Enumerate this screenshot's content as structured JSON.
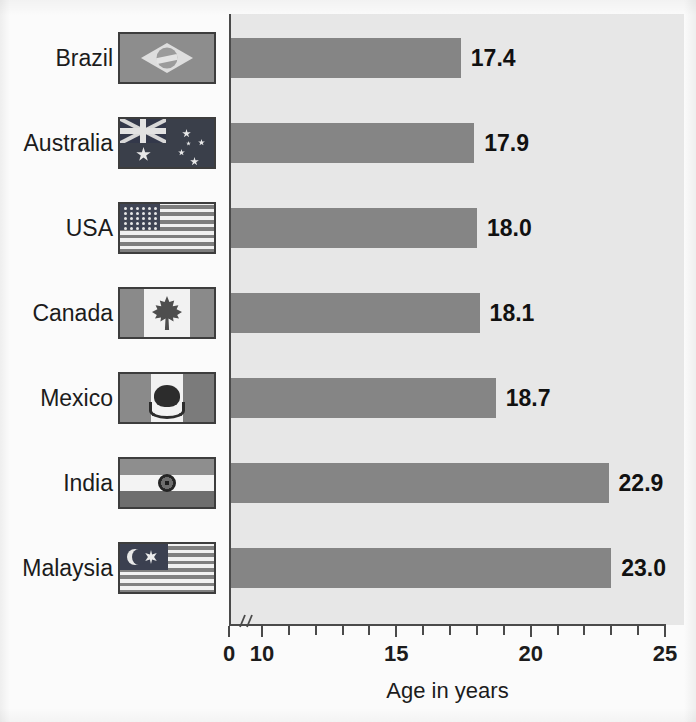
{
  "chart_data": {
    "type": "bar",
    "orientation": "horizontal",
    "title": "",
    "xlabel": "Age in years",
    "ylabel": "",
    "xlim": [
      0,
      25
    ],
    "axis_break": true,
    "axis_break_note": "broken axis between 0 and 10",
    "grid": false,
    "legend": "none",
    "tick_labels": [
      "0",
      "10",
      "15",
      "20",
      "25"
    ],
    "tick_values": [
      0,
      10,
      15,
      20,
      25
    ],
    "minor_tick_step": 1,
    "categories": [
      "Brazil",
      "Australia",
      "USA",
      "Canada",
      "Mexico",
      "India",
      "Malaysia"
    ],
    "values": [
      17.4,
      17.9,
      18.0,
      18.1,
      18.7,
      22.9,
      23.0
    ],
    "value_labels": [
      "17.4",
      "17.9",
      "18.0",
      "18.1",
      "18.7",
      "22.9",
      "23.0"
    ],
    "bar_color": "#858585",
    "plot_background": "#e7e7e7",
    "axis_color": "#4a4a4a"
  },
  "rows": [
    {
      "country": "Brazil",
      "value": 17.4,
      "label": "17.4",
      "flag": "brazil-flag-icon"
    },
    {
      "country": "Australia",
      "value": 17.9,
      "label": "17.9",
      "flag": "australia-flag-icon"
    },
    {
      "country": "USA",
      "value": 18.0,
      "label": "18.0",
      "flag": "usa-flag-icon"
    },
    {
      "country": "Canada",
      "value": 18.1,
      "label": "18.1",
      "flag": "canada-flag-icon"
    },
    {
      "country": "Mexico",
      "value": 18.7,
      "label": "18.7",
      "flag": "mexico-flag-icon"
    },
    {
      "country": "India",
      "value": 22.9,
      "label": "22.9",
      "flag": "india-flag-icon"
    },
    {
      "country": "Malaysia",
      "value": 23.0,
      "label": "23.0",
      "flag": "malaysia-flag-icon"
    }
  ],
  "axis": {
    "title": "Age in years",
    "ticks": [
      {
        "label": "0",
        "value": 0
      },
      {
        "label": "10",
        "value": 10
      },
      {
        "label": "15",
        "value": 15
      },
      {
        "label": "20",
        "value": 20
      },
      {
        "label": "25",
        "value": 25
      }
    ]
  }
}
